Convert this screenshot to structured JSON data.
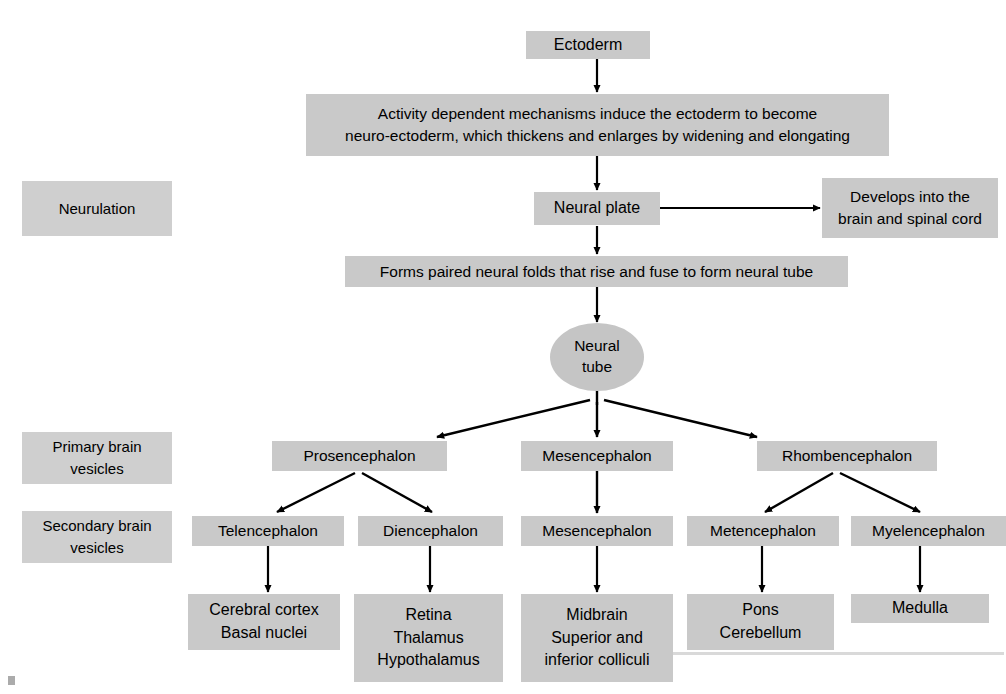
{
  "diagram": {
    "colors": {
      "node_fill": "#c9c9c9",
      "stage_label_fill": "#cfcfcf",
      "ellipse_fill": "#c5c5c5",
      "connector": "#000000",
      "background": "#ffffff"
    },
    "stage_labels": [
      {
        "id": "neurulation",
        "text": "Neurulation"
      },
      {
        "id": "primary-brain-vesicles",
        "lines": [
          "Primary brain",
          "vesicles"
        ]
      },
      {
        "id": "secondary-brain-vesicles",
        "lines": [
          "Secondary brain",
          "vesicles"
        ]
      }
    ],
    "nodes": {
      "ectoderm": {
        "lines": [
          "Ectoderm"
        ]
      },
      "activity_mechanisms": {
        "lines": [
          "Activity dependent mechanisms induce the ectoderm to become",
          "neuro-ectoderm, which thickens and enlarges by widening and elongating"
        ]
      },
      "neural_plate": {
        "lines": [
          "Neural plate"
        ]
      },
      "develops_into": {
        "lines": [
          "Develops into the",
          "brain and spinal cord"
        ]
      },
      "neural_folds": {
        "lines": [
          "Forms paired neural folds that rise and fuse to form neural tube"
        ]
      },
      "neural_tube": {
        "lines": [
          "Neural",
          "tube"
        ]
      },
      "prosencephalon": {
        "lines": [
          "Prosencephalon"
        ]
      },
      "mesencephalon_primary": {
        "lines": [
          "Mesencephalon"
        ]
      },
      "rhombencephalon": {
        "lines": [
          "Rhombencephalon"
        ]
      },
      "telencephalon": {
        "lines": [
          "Telencephalon"
        ]
      },
      "diencephalon": {
        "lines": [
          "Diencephalon"
        ]
      },
      "mesencephalon_secondary": {
        "lines": [
          "Mesencephalon"
        ]
      },
      "metencephalon": {
        "lines": [
          "Metencephalon"
        ]
      },
      "myelencephalon": {
        "lines": [
          "Myelencephalon"
        ]
      },
      "derivative_telencephalon": {
        "lines": [
          "Cerebral cortex",
          "Basal nuclei"
        ]
      },
      "derivative_diencephalon": {
        "lines": [
          "Retina",
          "Thalamus",
          "Hypothalamus"
        ]
      },
      "derivative_mesencephalon": {
        "lines": [
          "Midbrain",
          "Superior and",
          "inferior colliculi"
        ]
      },
      "derivative_metencephalon": {
        "lines": [
          "Pons",
          "Cerebellum"
        ]
      },
      "derivative_myelencephalon": {
        "lines": [
          "Medulla"
        ]
      }
    },
    "edges": [
      {
        "from": "ectoderm",
        "to": "activity_mechanisms",
        "style": "straight-down"
      },
      {
        "from": "activity_mechanisms",
        "to": "neural_plate",
        "style": "straight-down"
      },
      {
        "from": "neural_plate",
        "to": "develops_into",
        "style": "straight-right"
      },
      {
        "from": "neural_plate",
        "to": "neural_folds",
        "style": "straight-down"
      },
      {
        "from": "neural_folds",
        "to": "neural_tube",
        "style": "straight-down"
      },
      {
        "from": "neural_tube",
        "to": "prosencephalon",
        "style": "diagonal-left"
      },
      {
        "from": "neural_tube",
        "to": "mesencephalon_primary",
        "style": "straight-down"
      },
      {
        "from": "neural_tube",
        "to": "rhombencephalon",
        "style": "diagonal-right"
      },
      {
        "from": "prosencephalon",
        "to": "telencephalon",
        "style": "diagonal-left"
      },
      {
        "from": "prosencephalon",
        "to": "diencephalon",
        "style": "diagonal-right"
      },
      {
        "from": "mesencephalon_primary",
        "to": "mesencephalon_secondary",
        "style": "straight-down"
      },
      {
        "from": "rhombencephalon",
        "to": "metencephalon",
        "style": "diagonal-left"
      },
      {
        "from": "rhombencephalon",
        "to": "myelencephalon",
        "style": "diagonal-right"
      },
      {
        "from": "telencephalon",
        "to": "derivative_telencephalon",
        "style": "straight-down"
      },
      {
        "from": "diencephalon",
        "to": "derivative_diencephalon",
        "style": "straight-down"
      },
      {
        "from": "mesencephalon_secondary",
        "to": "derivative_mesencephalon",
        "style": "straight-down"
      },
      {
        "from": "metencephalon",
        "to": "derivative_metencephalon",
        "style": "straight-down"
      },
      {
        "from": "myelencephalon",
        "to": "derivative_myelencephalon",
        "style": "straight-down"
      }
    ]
  }
}
